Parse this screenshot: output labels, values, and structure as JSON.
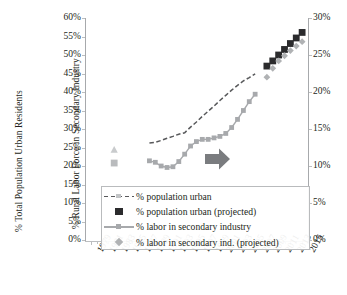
{
  "chart_data": {
    "type": "line",
    "title": "",
    "xlabel": "",
    "ylabel": "% Total Population Urban Residents",
    "ylabel_secondary": "% Rural Labor Force in Secondary Industry",
    "ylim": [
      0,
      60
    ],
    "ylim_secondary": [
      0,
      30
    ],
    "ytick_labels": [
      "0%",
      "5%",
      "10%",
      "15%",
      "20%",
      "25%",
      "30%",
      "35%",
      "40%",
      "45%",
      "50%",
      "55%",
      "60%"
    ],
    "ytick_values": [
      0,
      5,
      10,
      15,
      20,
      25,
      30,
      35,
      40,
      45,
      50,
      55,
      60
    ],
    "ytick_labels_secondary": [
      "0%",
      "5%",
      "10%",
      "15%",
      "20%",
      "25%",
      "30%"
    ],
    "ytick_values_secondary": [
      0,
      5,
      10,
      15,
      20,
      25,
      30
    ],
    "x": [
      1979,
      1981,
      1983,
      1985,
      1987,
      1989,
      1991,
      1993,
      1995,
      1997,
      1999,
      2001,
      2003,
      2005,
      2007,
      2009,
      2011,
      2013,
      2015
    ],
    "xtick_labels": [
      "1979",
      "1981",
      "1983",
      "1985",
      "1987",
      "1989",
      "1991",
      "1993",
      "1995",
      "1997",
      "1999",
      "2001",
      "2003",
      "2005",
      "2007",
      "2009",
      "2011",
      "2013",
      "2015"
    ],
    "grid": false,
    "legend_position": "lower-center",
    "annotations": [
      {
        "name": "trend-arrow",
        "shape": "right-arrow",
        "color": "#7a7c7f",
        "x": 2007,
        "y": 14
      }
    ],
    "series": [
      {
        "name": "% population urban",
        "axis": "left",
        "style": "dashed-line",
        "color": "#58595b",
        "points": [
          {
            "x": 1989,
            "y": 26.2
          },
          {
            "x": 1990,
            "y": 26.4
          },
          {
            "x": 1991,
            "y": 26.9
          },
          {
            "x": 1992,
            "y": 27.5
          },
          {
            "x": 1993,
            "y": 28.0
          },
          {
            "x": 1994,
            "y": 28.6
          },
          {
            "x": 1995,
            "y": 29.0
          },
          {
            "x": 1996,
            "y": 30.5
          },
          {
            "x": 1997,
            "y": 31.9
          },
          {
            "x": 1998,
            "y": 33.4
          },
          {
            "x": 1999,
            "y": 34.8
          },
          {
            "x": 2000,
            "y": 36.2
          },
          {
            "x": 2001,
            "y": 37.7
          },
          {
            "x": 2002,
            "y": 39.1
          },
          {
            "x": 2003,
            "y": 40.5
          },
          {
            "x": 2004,
            "y": 41.8
          },
          {
            "x": 2005,
            "y": 43.0
          },
          {
            "x": 2006,
            "y": 43.9
          },
          {
            "x": 2007,
            "y": 44.9
          }
        ]
      },
      {
        "name": "% population urban (projected)",
        "axis": "left",
        "style": "square-markers",
        "color": "#2b2b2d",
        "points": [
          {
            "x": 2009,
            "y": 47.0
          },
          {
            "x": 2010,
            "y": 48.4
          },
          {
            "x": 2011,
            "y": 50.0
          },
          {
            "x": 2012,
            "y": 51.5
          },
          {
            "x": 2013,
            "y": 53.1
          },
          {
            "x": 2014,
            "y": 54.6
          },
          {
            "x": 2015,
            "y": 56.1
          }
        ]
      },
      {
        "name": "% labor in secondary industry",
        "axis": "right",
        "style": "solid-line-square-markers",
        "color": "#a7a9ac",
        "points": [
          {
            "x": 1989,
            "y": 10.7
          },
          {
            "x": 1990,
            "y": 10.5
          },
          {
            "x": 1991,
            "y": 10.0
          },
          {
            "x": 1992,
            "y": 9.8
          },
          {
            "x": 1993,
            "y": 9.9
          },
          {
            "x": 1994,
            "y": 10.6
          },
          {
            "x": 1995,
            "y": 11.6
          },
          {
            "x": 1996,
            "y": 12.7
          },
          {
            "x": 1997,
            "y": 13.3
          },
          {
            "x": 1998,
            "y": 13.6
          },
          {
            "x": 1999,
            "y": 13.6
          },
          {
            "x": 2000,
            "y": 13.8
          },
          {
            "x": 2001,
            "y": 14.0
          },
          {
            "x": 2002,
            "y": 14.4
          },
          {
            "x": 2003,
            "y": 15.2
          },
          {
            "x": 2004,
            "y": 16.3
          },
          {
            "x": 2005,
            "y": 17.5
          },
          {
            "x": 2006,
            "y": 18.7
          },
          {
            "x": 2007,
            "y": 19.7
          }
        ]
      },
      {
        "name": "% labor in secondary ind. (projected)",
        "axis": "right",
        "style": "diamond-markers",
        "color": "#b0b2b4",
        "points": [
          {
            "x": 2009,
            "y": 22.0
          },
          {
            "x": 2010,
            "y": 23.2
          },
          {
            "x": 2011,
            "y": 24.2
          },
          {
            "x": 2012,
            "y": 24.9
          },
          {
            "x": 2013,
            "y": 25.6
          },
          {
            "x": 2014,
            "y": 26.2
          },
          {
            "x": 2015,
            "y": 26.8
          }
        ]
      },
      {
        "name": "early-marker-triangle",
        "axis": "right",
        "style": "triangle-marker",
        "color": "#c9cbcd",
        "points": [
          {
            "x": 1983,
            "y": 12.2
          }
        ]
      },
      {
        "name": "early-marker-square",
        "axis": "right",
        "style": "square-marker",
        "color": "#b9bbbd",
        "points": [
          {
            "x": 1983,
            "y": 10.4
          }
        ]
      }
    ],
    "legend": [
      {
        "label": "% population urban",
        "marker": "dashed-line"
      },
      {
        "label": "% population urban (projected)",
        "marker": "filled-square"
      },
      {
        "label": "% labor in secondary industry",
        "marker": "line-with-square"
      },
      {
        "label": "% labor in secondary ind. (projected)",
        "marker": "diamond"
      }
    ]
  }
}
